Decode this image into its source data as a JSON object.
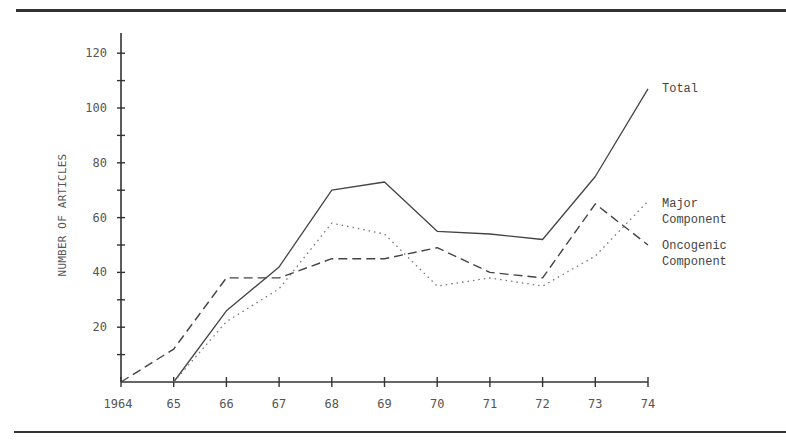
{
  "chart_data": {
    "type": "line",
    "title": "",
    "xlabel": "",
    "ylabel": "NUMBER OF ARTICLES",
    "categories": [
      "1964",
      "65",
      "66",
      "67",
      "68",
      "69",
      "70",
      "71",
      "72",
      "73",
      "74"
    ],
    "yticks": [
      20,
      40,
      60,
      80,
      100,
      120
    ],
    "ylim": [
      0,
      125
    ],
    "grid": false,
    "legend_position": "right, inline labels at line ends",
    "series": [
      {
        "name": "Total",
        "style": "solid",
        "values": [
          null,
          0,
          26,
          42,
          70,
          73,
          55,
          54,
          52,
          75,
          107
        ]
      },
      {
        "name": "Major Component",
        "style": "dotted",
        "values": [
          null,
          0,
          22,
          34,
          58,
          54,
          35,
          38,
          35,
          46,
          66
        ]
      },
      {
        "name": "Oncogenic Component",
        "style": "dashed",
        "values": [
          0,
          12,
          38,
          38,
          45,
          45,
          49,
          40,
          38,
          65,
          50
        ]
      }
    ]
  },
  "axis": {
    "ylabel": "NUMBER OF ARTICLES",
    "yticks": [
      "20",
      "40",
      "60",
      "80",
      "100",
      "120"
    ],
    "xticks": [
      "1964",
      "65",
      "66",
      "67",
      "68",
      "69",
      "70",
      "71",
      "72",
      "73",
      "74"
    ]
  },
  "legend": {
    "total": "Total",
    "major_line1": "Major",
    "major_line2": "Component",
    "oncogenic_line1": "Oncogenic",
    "oncogenic_line2": "Component"
  }
}
